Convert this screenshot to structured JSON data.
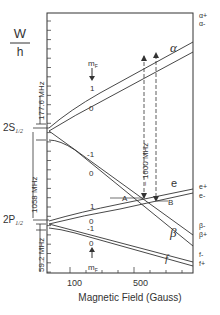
{
  "axis": {
    "y_label_top": "W",
    "y_label_bottom": "h",
    "x_label": "Magnetic Field (Gauss)",
    "x_ticks": [
      "100",
      "500"
    ]
  },
  "levels": {
    "upper": "2S",
    "upper_sub": "1/2",
    "lower": "2P",
    "lower_sub": "1/2"
  },
  "spans": {
    "s_split": "177.6 MHz",
    "lamb": "1058 MHz",
    "p_split": "59.2 MHz",
    "transition": "~ 1600 MHz"
  },
  "mf_label": "m",
  "mf_sub": "F",
  "curve_labels": {
    "alpha": "α",
    "e": "e",
    "beta": "β",
    "f": "f",
    "A": "A",
    "B": "B"
  },
  "mf_values": {
    "alpha_upper": "1",
    "alpha_lower": "0",
    "beta_upper": "-1",
    "beta_lower": "0",
    "e_upper": "1",
    "e_lower": "0",
    "f_upper": "-1",
    "f_lower": "0"
  },
  "right_labels": [
    "α+",
    "α-",
    "e+",
    "e-",
    "β-",
    "β+",
    "f-",
    "f+"
  ]
}
